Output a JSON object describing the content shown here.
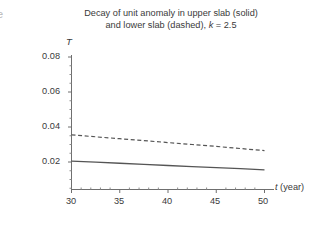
{
  "figure": {
    "edge_glyph": "e",
    "title_line_1": "Decay of unit anomaly in upper slab (solid)",
    "title_line_2_pre": "and lower slab (dashed), ",
    "title_line_2_k": "k",
    "title_line_2_post": " = 2.5"
  },
  "axes": {
    "y_axis_label": "T",
    "x_axis_label_symbol": "t",
    "x_axis_label_unit": " (year)",
    "y_ticks": [
      "0.08",
      "0.06",
      "0.04",
      "0.02"
    ],
    "x_ticks": [
      "30",
      "35",
      "40",
      "45",
      "50"
    ]
  },
  "chart_data": {
    "type": "line",
    "title": "Decay of unit anomaly in upper slab (solid) and lower slab (dashed), k = 2.5",
    "xlabel": "t (year)",
    "ylabel": "T",
    "xlim": [
      30,
      50
    ],
    "ylim": [
      0,
      0.08
    ],
    "xticks": [
      30,
      35,
      40,
      45,
      50
    ],
    "yticks": [
      0.02,
      0.04,
      0.06,
      0.08
    ],
    "grid": false,
    "legend": "none",
    "annotations": [
      "k = 2.5"
    ],
    "x": [
      30,
      32.5,
      35,
      37.5,
      40,
      42.5,
      45,
      47.5,
      50
    ],
    "series": [
      {
        "name": "lower slab (dashed)",
        "style": "dashed",
        "color": "#555555",
        "values": [
          0.0355,
          0.0344,
          0.0333,
          0.0322,
          0.0311,
          0.03,
          0.0289,
          0.0277,
          0.0265
        ]
      },
      {
        "name": "upper slab (solid)",
        "style": "solid",
        "color": "#555555",
        "values": [
          0.0205,
          0.0199,
          0.0193,
          0.0187,
          0.018,
          0.0174,
          0.0168,
          0.0162,
          0.0155
        ]
      }
    ]
  }
}
